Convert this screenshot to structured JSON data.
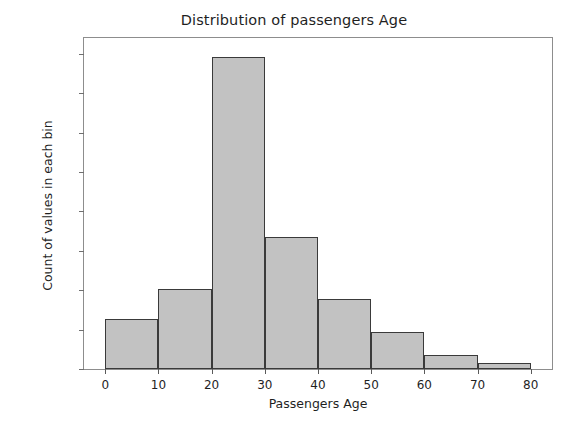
{
  "chart_data": {
    "type": "bar",
    "title": "Distribution of passengers Age",
    "xlabel": "Passengers Age",
    "ylabel": "Count of values in each bin",
    "categories": [
      "0-10",
      "10-20",
      "20-30",
      "30-40",
      "40-50",
      "50-60",
      "60-70",
      "70-80"
    ],
    "bin_edges": [
      0,
      10,
      20,
      30,
      40,
      50,
      60,
      70,
      80
    ],
    "values": [
      64,
      102,
      396,
      167,
      89,
      47,
      18,
      7
    ],
    "xlim": [
      -4,
      84
    ],
    "ylim": [
      0,
      420
    ],
    "xticks": [
      0,
      10,
      20,
      30,
      40,
      50,
      60,
      70,
      80
    ],
    "xtick_labels": [
      "0",
      "10",
      "20",
      "30",
      "40",
      "50",
      "60",
      "70",
      "80"
    ],
    "yticks": [
      0,
      50,
      100,
      150,
      200,
      250,
      300,
      350,
      400
    ],
    "ytick_labels": [
      "0",
      "50",
      "100",
      "150",
      "200",
      "250",
      "300",
      "350",
      "400"
    ],
    "grid": false,
    "legend": null,
    "bar_fill_color": "#c2c2c2",
    "bar_edge_color": "#3a3a3a",
    "axes_color": "#8d8d8d",
    "background_color": "#ffffff"
  }
}
